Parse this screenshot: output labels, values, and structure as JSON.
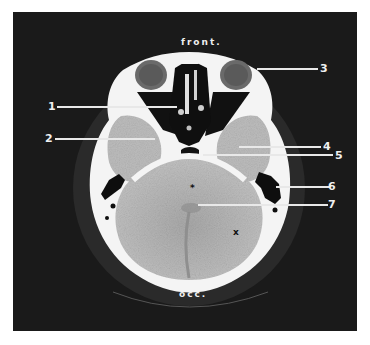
{
  "figure": {
    "type": "axial CT scan of head",
    "orientation": {
      "top": "front.",
      "bottom": "occ."
    },
    "labels": [
      {
        "id": "1",
        "text": "1"
      },
      {
        "id": "2",
        "text": "2"
      },
      {
        "id": "3",
        "text": "3"
      },
      {
        "id": "4",
        "text": "4"
      },
      {
        "id": "5",
        "text": "5"
      },
      {
        "id": "6",
        "text": "6"
      },
      {
        "id": "7",
        "text": "7"
      }
    ],
    "markers": {
      "asterisk": "*",
      "cross": "x"
    },
    "colors": {
      "background": "#1a1a1a",
      "bone": "#f4f4f4",
      "brain": "#b8b8b8",
      "air": "#0d0d0d",
      "leader_lines": "#e8e8e8"
    }
  }
}
